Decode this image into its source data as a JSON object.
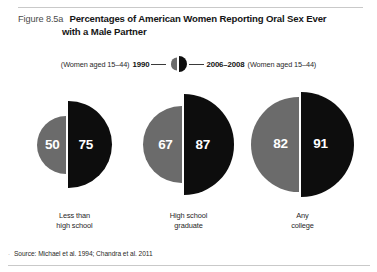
{
  "figure": {
    "number": "Figure 8.5a",
    "title": "Percentages of American Women Reporting Oral Sex Ever with a Male Partner",
    "title_line1": "Percentages of American Women Reporting Oral Sex Ever",
    "title_line2": "with a Male Partner",
    "source_bullet": "·",
    "source": "Source: Michael et al. 1994; Chandra et al. 2011"
  },
  "legend": {
    "left_paren": "(Women aged 15–44)",
    "left_year": "1990",
    "right_year": "2006–2008",
    "right_paren": "(Women aged 15–44)",
    "icon": "split-circle-icon",
    "left_color": "#6b6b6b",
    "right_color": "#0d0d0d"
  },
  "chart_data": {
    "type": "bar",
    "title": "Percentages of American Women Reporting Oral Sex Ever with a Male Partner",
    "xlabel": "",
    "ylabel": "Percent",
    "ylim": [
      0,
      100
    ],
    "grid": false,
    "legend_position": "top",
    "categories": [
      "Less than high school",
      "High school graduate",
      "Any college"
    ],
    "category_lines": [
      [
        "Less than",
        "high school"
      ],
      [
        "High school",
        "graduate"
      ],
      [
        "Any",
        "college"
      ]
    ],
    "series": [
      {
        "name": "1990",
        "color": "#6b6b6b",
        "values": [
          50,
          67,
          82
        ]
      },
      {
        "name": "2006–2008",
        "color": "#0d0d0d",
        "values": [
          75,
          87,
          91
        ]
      }
    ],
    "annotations": [
      "(Women aged 15–44)"
    ],
    "source": "Source: Michael et al. 1994; Chandra et al. 2011"
  }
}
